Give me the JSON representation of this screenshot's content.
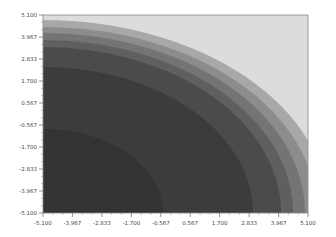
{
  "chart_data": {
    "type": "contour",
    "title": "",
    "xlabel": "",
    "ylabel": "",
    "xlim": [
      -5.1,
      5.1
    ],
    "ylim": [
      -5.1,
      5.1
    ],
    "grid": false,
    "legend": null,
    "colormap": "greys (dark = low, light = high)",
    "x_ticks": [
      "-5.100",
      "-3.967",
      "-2.833",
      "-1.700",
      "-0.567",
      "0.567",
      "1.700",
      "2.833",
      "3.967",
      "5.100"
    ],
    "y_ticks": [
      "-5.100",
      "-3.967",
      "-2.833",
      "-1.700",
      "-0.567",
      "0.567",
      "1.700",
      "2.833",
      "3.967",
      "5.100"
    ],
    "levels": [
      {
        "band": 1,
        "color": "#3a3a3a",
        "radius_fraction": 0.8
      },
      {
        "band": 2,
        "color": "#4a4a4a",
        "radius_fraction": 0.86
      },
      {
        "band": 3,
        "color": "#5e5e5e",
        "radius_fraction": 0.9
      },
      {
        "band": 4,
        "color": "#737373",
        "radius_fraction": 0.935
      },
      {
        "band": 5,
        "color": "#8a8a8a",
        "radius_fraction": 0.965
      },
      {
        "band": 6,
        "color": "#a5a5a5",
        "radius_fraction": 1.0
      },
      {
        "band": 7,
        "color": "#d8d8d8",
        "radius_fraction": null
      }
    ]
  },
  "axes": {
    "x_tick_labels": [
      "-5.100",
      "-3.967",
      "-2.833",
      "-1.700",
      "-0.567",
      "0.567",
      "1.700",
      "2.833",
      "3.967",
      "5.100"
    ],
    "y_tick_labels": [
      "5.100",
      "3.967",
      "2.833",
      "1.700",
      "0.567",
      "-0.567",
      "-1.700",
      "-2.833",
      "-3.967",
      "-5.100"
    ]
  }
}
